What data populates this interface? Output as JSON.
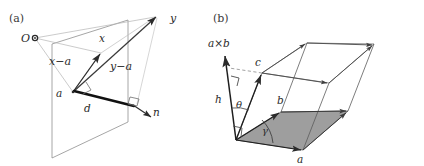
{
  "figure": {
    "title_a": "(a)",
    "title_b": "(b)",
    "background": "#ffffff",
    "ink": "#2b2b2b",
    "light_ink": "#9a9a9a",
    "shade_fill": "#9e9e9e"
  },
  "panel_a": {
    "label": "(a)",
    "caption_note": "Point-to-plane distance diagram",
    "labels": {
      "origin": "O",
      "point_x": "x",
      "point_y": "y",
      "point_a": "a",
      "vector_x_minus_a": "x−a",
      "vector_y_minus_a": "y−a",
      "distance_d": "d",
      "normal_n": "n"
    },
    "geometry": {
      "plane_polygon": "52,44 128,20 128,122 52,158",
      "origin_pt": [
        35,
        38
      ],
      "x_pt": [
        101,
        53
      ],
      "y_pt": [
        157,
        16
      ],
      "a_pt": [
        73,
        92
      ],
      "n_tip": [
        150,
        116
      ],
      "foot_pt": [
        137,
        103
      ]
    }
  },
  "panel_b": {
    "label": "(b)",
    "caption_note": "Parallelepiped volume / scalar triple product",
    "labels": {
      "cross_product": "a×b",
      "height": "h",
      "theta": "θ",
      "gamma": "γ",
      "vector_a": "a",
      "vector_b": "b",
      "vector_c": "c"
    },
    "geometry": {
      "origin_pt": [
        236,
        140
      ],
      "a_tip": [
        303,
        150
      ],
      "b_tip": [
        281,
        112
      ],
      "c_tip": [
        262,
        73
      ],
      "cross_tip": [
        224,
        54
      ],
      "base_polygon": "236,140 303,150 348,111 281,112",
      "top_polygon": "262,73 329,83 374,44 307,43"
    }
  }
}
